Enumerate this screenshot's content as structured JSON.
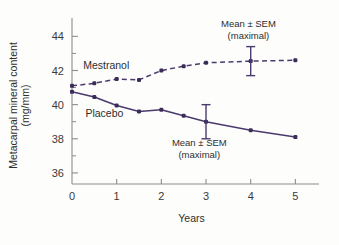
{
  "chart_data": {
    "type": "line",
    "title": "",
    "xlabel": "Years",
    "ylabel": "Metacarpal mineral content (mg/mm)",
    "ylabel_line1": "Metacarpal mineral content",
    "ylabel_line2": "(mg/mm)",
    "xlim": [
      0,
      5.35
    ],
    "ylim": [
      35.0,
      44.9
    ],
    "xticks": [
      0,
      1,
      2,
      3,
      4,
      5
    ],
    "xtick_labels": [
      "0",
      "1",
      "2",
      "3",
      "4",
      "5"
    ],
    "xticks_minor": [
      0.5,
      1.5,
      2.5,
      3.5,
      4.5
    ],
    "yticks": [
      36,
      38,
      40,
      42,
      44
    ],
    "ytick_labels": [
      "36",
      "38",
      "40",
      "42",
      "44"
    ],
    "yticks_minor": [
      37,
      39,
      41,
      43
    ],
    "grid": false,
    "legend_position": "inline-labels",
    "x": [
      0,
      0.5,
      1,
      1.5,
      2,
      2.5,
      3,
      4,
      5
    ],
    "series": [
      {
        "name": "Mestranol",
        "label": "Mestranol",
        "style": "dashed",
        "color": "#4a3a6e",
        "values": [
          41.1,
          41.25,
          41.5,
          41.45,
          42.0,
          42.25,
          42.45,
          42.55,
          42.6
        ],
        "error_bar": {
          "x": 4,
          "y": 42.55,
          "sem": 0.85,
          "lower": 41.7,
          "upper": 43.4
        },
        "label_pos": {
          "x": 0.25,
          "y": 42.1
        }
      },
      {
        "name": "Placebo",
        "label": "Placebo",
        "style": "solid",
        "color": "#4a3a6e",
        "values": [
          40.75,
          40.45,
          39.95,
          39.6,
          39.7,
          39.35,
          39.0,
          38.5,
          38.1
        ],
        "error_bar": {
          "x": 3,
          "y": 39.0,
          "sem": 1.0,
          "lower": 38.0,
          "upper": 40.0
        },
        "label_pos": {
          "x": 0.3,
          "y": 39.3
        }
      }
    ],
    "annotations": [
      {
        "id": "mestranol-sem-note",
        "line1": "Mean ± SEM",
        "line2": "(maximal)",
        "x": 3.95,
        "y": 44.55
      },
      {
        "id": "placebo-sem-note",
        "line1": "Mean ± SEM",
        "line2": "(maximal)",
        "x": 2.85,
        "y": 37.55
      }
    ],
    "colors": {
      "line": "#4a3a6e",
      "marker": "#3b2d58",
      "axis": "#8d8d8d",
      "text": "#2e2e2e",
      "background": "#fdfdfc"
    }
  }
}
